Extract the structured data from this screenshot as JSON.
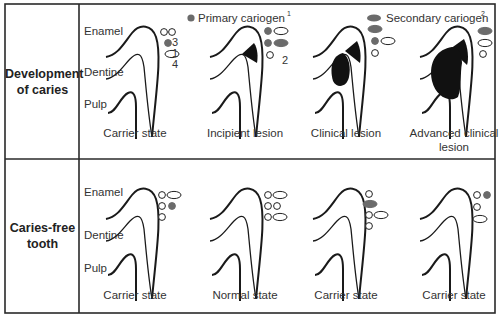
{
  "legend": {
    "primary": {
      "label": "Primary cariogen",
      "superscript": "1",
      "color": "#6b6b6b"
    },
    "secondary": {
      "label": "Secondary cariogen",
      "superscript": "2",
      "color": "#6b6b6b"
    }
  },
  "layers": {
    "enamel": "Enamel",
    "dentine": "Dentine",
    "pulp": "Pulp"
  },
  "rows": [
    {
      "label_line1": "Development",
      "label_line2": "of caries",
      "panels": [
        {
          "caption": "Carrier state",
          "caption2": "",
          "lesion": "none",
          "microbes": [
            {
              "kind": "circle",
              "fill": "open"
            },
            {
              "kind": "circle",
              "fill": "open"
            },
            {
              "kind": "circle",
              "fill": "primary"
            },
            {
              "kind": "oval",
              "fill": "open"
            }
          ],
          "counts": [
            "3",
            "1",
            "4"
          ]
        },
        {
          "caption": "Incipient lesion",
          "caption2": "",
          "lesion": "incipient",
          "microbes": [
            {
              "kind": "circle",
              "fill": "primary"
            },
            {
              "kind": "oval",
              "fill": "open"
            },
            {
              "kind": "circle",
              "fill": "primary"
            },
            {
              "kind": "oval",
              "fill": "secondary"
            },
            {
              "kind": "circle",
              "fill": "open"
            }
          ],
          "counts": [
            "2"
          ]
        },
        {
          "caption": "Clinical lesion",
          "caption2": "",
          "lesion": "clinical",
          "microbes": [
            {
              "kind": "oval",
              "fill": "secondary"
            },
            {
              "kind": "circle",
              "fill": "primary"
            },
            {
              "kind": "oval",
              "fill": "open"
            },
            {
              "kind": "circle",
              "fill": "open"
            }
          ]
        },
        {
          "caption": "Advanced clinical",
          "caption2": "lesion",
          "lesion": "advanced",
          "microbes": [
            {
              "kind": "oval",
              "fill": "secondary"
            },
            {
              "kind": "oval",
              "fill": "open"
            },
            {
              "kind": "circle",
              "fill": "open"
            }
          ]
        }
      ]
    },
    {
      "label_line1": "Caries-free",
      "label_line2": "tooth",
      "panels": [
        {
          "caption": "Carrier state",
          "caption2": "",
          "lesion": "none",
          "microbes": [
            {
              "kind": "circle",
              "fill": "open"
            },
            {
              "kind": "oval",
              "fill": "open"
            },
            {
              "kind": "circle",
              "fill": "open"
            },
            {
              "kind": "circle",
              "fill": "primary"
            },
            {
              "kind": "circle",
              "fill": "open"
            }
          ]
        },
        {
          "caption": "Normal state",
          "caption2": "",
          "lesion": "none",
          "microbes": [
            {
              "kind": "circle",
              "fill": "open"
            },
            {
              "kind": "oval",
              "fill": "open"
            },
            {
              "kind": "circle",
              "fill": "open"
            },
            {
              "kind": "circle",
              "fill": "open"
            },
            {
              "kind": "circle",
              "fill": "open"
            },
            {
              "kind": "oval",
              "fill": "open"
            }
          ]
        },
        {
          "caption": "Carrier state",
          "caption2": "",
          "lesion": "none",
          "microbes": [
            {
              "kind": "circle",
              "fill": "open"
            },
            {
              "kind": "oval",
              "fill": "secondary"
            },
            {
              "kind": "circle",
              "fill": "open"
            },
            {
              "kind": "oval",
              "fill": "open"
            },
            {
              "kind": "circle",
              "fill": "open"
            }
          ]
        },
        {
          "caption": "Carrier state",
          "caption2": "",
          "lesion": "none",
          "microbes": [
            {
              "kind": "circle",
              "fill": "open"
            },
            {
              "kind": "circle",
              "fill": "primary"
            },
            {
              "kind": "circle",
              "fill": "open"
            },
            {
              "kind": "oval",
              "fill": "open"
            }
          ]
        }
      ]
    }
  ]
}
